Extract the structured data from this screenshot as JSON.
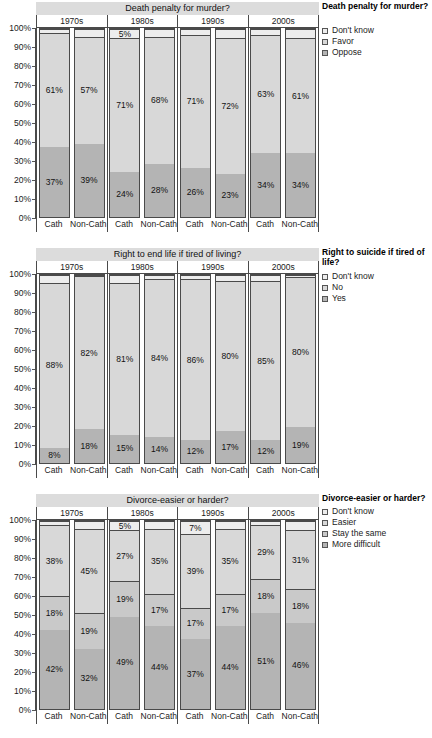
{
  "colors": {
    "dark": "#b4b4b4",
    "mid": "#c9c9c9",
    "light": "#d8d8d8",
    "lightest": "#ededed",
    "strip": "#dcdcdc",
    "line": "#4a4a4a"
  },
  "yticks": [
    "100%",
    "90%",
    "80%",
    "70%",
    "60%",
    "50%",
    "40%",
    "30%",
    "20%",
    "10%",
    "0%"
  ],
  "decades": [
    "1970s",
    "1980s",
    "1990s",
    "2000s"
  ],
  "group_labels": [
    "Cath",
    "Non-Cath"
  ],
  "chart_data": [
    {
      "type": "bar",
      "title": "Death penalty for murder?",
      "legend_title": "Death penalty for murder?",
      "xlabel": "",
      "ylabel": "",
      "ylim": [
        0,
        100
      ],
      "grid": false,
      "legend_position": "right",
      "stacked": true,
      "categories": [
        "1970s Cath",
        "1970s Non-Cath",
        "1980s Cath",
        "1980s Non-Cath",
        "1990s Cath",
        "1990s Non-Cath",
        "2000s Cath",
        "2000s Non-Cath"
      ],
      "series": [
        {
          "name": "Oppose",
          "color": "#b4b4b4",
          "values": [
            37,
            39,
            24,
            28,
            26,
            23,
            34,
            34
          ],
          "labels": [
            "37%",
            "39%",
            "24%",
            "28%",
            "26%",
            "23%",
            "34%",
            "34%"
          ]
        },
        {
          "name": "Favor",
          "color": "#d8d8d8",
          "values": [
            61,
            57,
            71,
            68,
            71,
            72,
            63,
            61
          ],
          "labels": [
            "61%",
            "57%",
            "71%",
            "68%",
            "71%",
            "72%",
            "63%",
            "61%"
          ]
        },
        {
          "name": "Don't know",
          "color": "#ededed",
          "values": [
            2,
            4,
            5,
            4,
            3,
            5,
            3,
            5
          ],
          "labels": [
            "",
            "",
            "5%",
            "",
            "",
            "",
            "",
            ""
          ]
        }
      ],
      "legend_entries": [
        "Don't know",
        "Favor",
        "Oppose"
      ]
    },
    {
      "type": "bar",
      "title": "Right to end life if tired of living?",
      "legend_title": "Right to suicide if tired of life?",
      "xlabel": "",
      "ylabel": "",
      "ylim": [
        0,
        100
      ],
      "grid": false,
      "legend_position": "right",
      "stacked": true,
      "categories": [
        "1970s Cath",
        "1970s Non-Cath",
        "1980s Cath",
        "1980s Non-Cath",
        "1990s Cath",
        "1990s Non-Cath",
        "2000s Cath",
        "2000s Non-Cath"
      ],
      "series": [
        {
          "name": "Yes",
          "color": "#b4b4b4",
          "values": [
            8,
            18,
            15,
            14,
            12,
            17,
            12,
            19
          ],
          "labels": [
            "8%",
            "18%",
            "15%",
            "14%",
            "12%",
            "17%",
            "12%",
            "19%"
          ]
        },
        {
          "name": "No",
          "color": "#d8d8d8",
          "values": [
            88,
            82,
            81,
            84,
            86,
            80,
            85,
            80
          ],
          "labels": [
            "88%",
            "82%",
            "81%",
            "84%",
            "86%",
            "80%",
            "85%",
            "80%"
          ]
        },
        {
          "name": "Don't know",
          "color": "#ededed",
          "values": [
            4,
            0,
            4,
            2,
            2,
            3,
            3,
            1
          ],
          "labels": [
            "",
            "",
            "",
            "",
            "",
            "",
            "",
            ""
          ]
        }
      ],
      "legend_entries": [
        "Don't know",
        "No",
        "Yes"
      ]
    },
    {
      "type": "bar",
      "title": "Divorce-easier or harder?",
      "legend_title": "Divorce-easier or harder?",
      "xlabel": "",
      "ylabel": "",
      "ylim": [
        0,
        100
      ],
      "grid": false,
      "legend_position": "right",
      "stacked": true,
      "categories": [
        "1970s Cath",
        "1970s Non-Cath",
        "1980s Cath",
        "1980s Non-Cath",
        "1990s Cath",
        "1990s Non-Cath",
        "2000s Cath",
        "2000s Non-Cath"
      ],
      "series": [
        {
          "name": "More difficult",
          "color": "#b4b4b4",
          "values": [
            42,
            32,
            49,
            44,
            37,
            44,
            51,
            46
          ],
          "labels": [
            "42%",
            "32%",
            "49%",
            "44%",
            "37%",
            "44%",
            "51%",
            "46%"
          ]
        },
        {
          "name": "Stay the same",
          "color": "#c9c9c9",
          "values": [
            18,
            19,
            19,
            17,
            17,
            17,
            18,
            18
          ],
          "labels": [
            "18%",
            "19%",
            "19%",
            "17%",
            "17%",
            "17%",
            "18%",
            "18%"
          ]
        },
        {
          "name": "Easier",
          "color": "#d8d8d8",
          "values": [
            38,
            45,
            27,
            35,
            39,
            35,
            29,
            31
          ],
          "labels": [
            "38%",
            "45%",
            "27%",
            "35%",
            "39%",
            "35%",
            "29%",
            "31%"
          ]
        },
        {
          "name": "Don't know",
          "color": "#ededed",
          "values": [
            2,
            4,
            5,
            4,
            7,
            4,
            2,
            5
          ],
          "labels": [
            "",
            "",
            "5%",
            "",
            "7%",
            "",
            "",
            ""
          ]
        }
      ],
      "legend_entries": [
        "Don't know",
        "Easier",
        "Stay the same",
        "More difficult"
      ]
    }
  ]
}
